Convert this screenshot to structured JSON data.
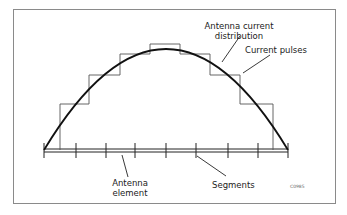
{
  "diagram": {
    "labels": {
      "current_distribution_line1": "Antenna current",
      "current_distribution_line2": "distribution",
      "current_pulses": "Current pulses",
      "antenna_element_line1": "Antenna",
      "antenna_element_line2": "element",
      "segments": "Segments",
      "figure_code": "C0985"
    },
    "segment_count": 8,
    "colors": {
      "line": "#222222",
      "frame": "#8a8a8a",
      "background": "#ffffff"
    }
  }
}
